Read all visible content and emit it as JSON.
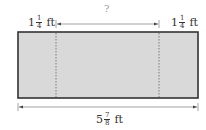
{
  "diagram": {
    "type": "dimension-diagram",
    "shape": "rectangle",
    "fill_color": "#d9d9d9",
    "border_color": "#333333",
    "left_section": {
      "whole": "1",
      "numerator": "1",
      "denominator": "4",
      "unit": "ft"
    },
    "right_section": {
      "whole": "1",
      "numerator": "1",
      "denominator": "4",
      "unit": "ft"
    },
    "middle_section": {
      "label": "?"
    },
    "total_width": {
      "whole": "5",
      "numerator": "7",
      "denominator": "8",
      "unit": "ft"
    }
  }
}
